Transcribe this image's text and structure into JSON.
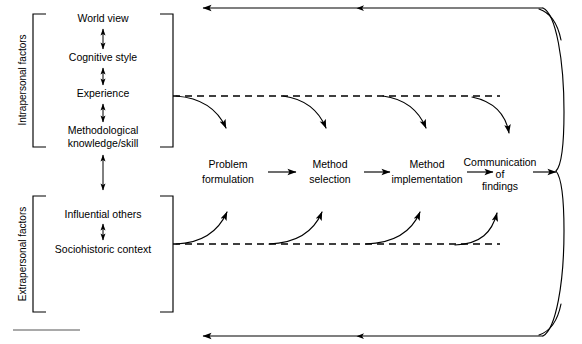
{
  "figure": {
    "width": 582,
    "height": 344,
    "background_color": "#ffffff",
    "line_color": "#000000"
  },
  "groups": {
    "intrapersonal": {
      "label": "Intrapersonal factors",
      "items": [
        "World view",
        "Cognitive style",
        "Experience",
        "Methodological\nknowledge/skill"
      ],
      "item_lines": [
        [
          "World view"
        ],
        [
          "Cognitive style"
        ],
        [
          "Experience"
        ],
        [
          "Methodological",
          "knowledge/skill"
        ]
      ]
    },
    "extrapersonal": {
      "label": "Extrapersonal factors",
      "items": [
        "Influential others",
        "Sociohistoric context"
      ],
      "item_lines": [
        [
          "Influential others"
        ],
        [
          "Sociohistoric context"
        ]
      ]
    }
  },
  "process": {
    "steps": [
      {
        "lines": [
          "Problem",
          "formulation"
        ]
      },
      {
        "lines": [
          "Method",
          "selection"
        ]
      },
      {
        "lines": [
          "Method",
          "implementation"
        ]
      },
      {
        "lines": [
          "Communication",
          "of",
          "findings"
        ]
      }
    ]
  },
  "connectors": {
    "vertical_double_arrows": 4,
    "influence_arrows_top": 4,
    "influence_arrows_bottom": 4,
    "feedback_arrowheads_top": 2,
    "feedback_arrowheads_bottom": 2,
    "dashed_line_count": 2,
    "curly_brace": true
  }
}
